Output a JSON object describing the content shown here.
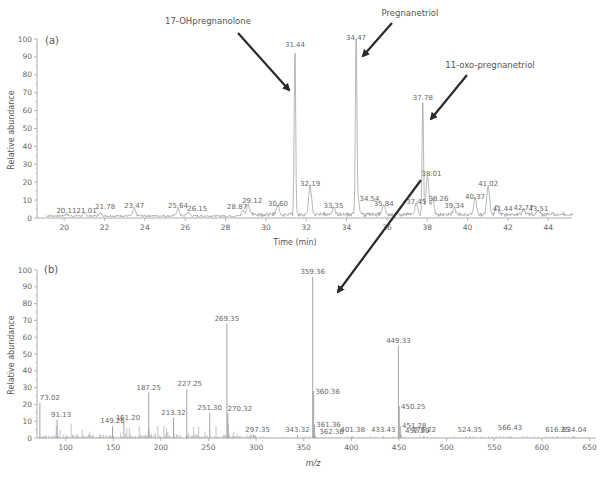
{
  "chart_data": [
    {
      "type": "line",
      "panel": "(a)",
      "title": "",
      "xlabel": "Time (min)",
      "ylabel": "Relative abundance",
      "xlim": [
        18.8,
        45.2
      ],
      "ylim": [
        0,
        100
      ],
      "xticks": [
        20,
        22,
        24,
        26,
        28,
        30,
        32,
        34,
        36,
        38,
        40,
        42,
        44
      ],
      "yticks": [
        0,
        10,
        20,
        30,
        40,
        50,
        60,
        70,
        80,
        90,
        100
      ],
      "grid": false,
      "peaks": [
        {
          "x": 20.11,
          "y": 1,
          "label": "20.11"
        },
        {
          "x": 21.01,
          "y": 1,
          "label": "21.01"
        },
        {
          "x": 21.78,
          "y": 1.5,
          "label": "21.78"
        },
        {
          "x": 23.47,
          "y": 4,
          "label": "23.47"
        },
        {
          "x": 25.64,
          "y": 4,
          "label": "25.64"
        },
        {
          "x": 26.15,
          "y": 2,
          "label": "26.15"
        },
        {
          "x": 28.87,
          "y": 3,
          "label": "28.87"
        },
        {
          "x": 29.12,
          "y": 6,
          "label": "29.12"
        },
        {
          "x": 30.6,
          "y": 5,
          "label": "30.60"
        },
        {
          "x": 31.44,
          "y": 94,
          "label": "31.44"
        },
        {
          "x": 32.19,
          "y": 16,
          "label": "32.19"
        },
        {
          "x": 33.35,
          "y": 4,
          "label": "33.35"
        },
        {
          "x": 34.47,
          "y": 98,
          "label": "34.47"
        },
        {
          "x": 34.54,
          "y": 12,
          "label": "34.54"
        },
        {
          "x": 35.84,
          "y": 5,
          "label": "35.84"
        },
        {
          "x": 37.45,
          "y": 6,
          "label": "37.45"
        },
        {
          "x": 37.78,
          "y": 64,
          "label": "37.78"
        },
        {
          "x": 38.01,
          "y": 22,
          "label": "38.01"
        },
        {
          "x": 38.26,
          "y": 9,
          "label": "38.26"
        },
        {
          "x": 39.34,
          "y": 4,
          "label": "39.34"
        },
        {
          "x": 40.37,
          "y": 9,
          "label": "40.37"
        },
        {
          "x": 41.02,
          "y": 16,
          "label": "41.02"
        },
        {
          "x": 41.44,
          "y": 5,
          "label": "41.44"
        },
        {
          "x": 42.77,
          "y": 3,
          "label": "42.77"
        },
        {
          "x": 43.51,
          "y": 2,
          "label": "43.51"
        }
      ],
      "annotations": [
        {
          "text": "17-OHpregnanolone",
          "points_to": 31.44
        },
        {
          "text": "Pregnanetriol",
          "points_to": 34.47
        },
        {
          "text": "11-oxo-pregnanetriol",
          "points_to": 37.78
        }
      ]
    },
    {
      "type": "bar",
      "panel": "(b)",
      "title": "",
      "xlabel": "m/z",
      "ylabel": "Relative abundance",
      "xlim": [
        70,
        655
      ],
      "ylim": [
        0,
        100
      ],
      "xticks": [
        100,
        150,
        200,
        250,
        300,
        350,
        400,
        450,
        500,
        550,
        600,
        650
      ],
      "yticks": [
        0,
        10,
        20,
        30,
        40,
        50,
        60,
        70,
        80,
        90,
        100
      ],
      "grid": false,
      "peaks": [
        {
          "x": 73.02,
          "y": 21,
          "label": "73.02"
        },
        {
          "x": 91.13,
          "y": 11,
          "label": "91.13"
        },
        {
          "x": 149.26,
          "y": 7,
          "label": "149.26"
        },
        {
          "x": 161.2,
          "y": 9,
          "label": "161.20"
        },
        {
          "x": 187.25,
          "y": 27,
          "label": "187.25"
        },
        {
          "x": 213.32,
          "y": 12,
          "label": "213.32"
        },
        {
          "x": 227.25,
          "y": 29,
          "label": "227.25"
        },
        {
          "x": 251.3,
          "y": 15,
          "label": "251.30"
        },
        {
          "x": 269.35,
          "y": 68,
          "label": "269.35"
        },
        {
          "x": 270.32,
          "y": 15,
          "label": "270.32"
        },
        {
          "x": 297.35,
          "y": 2,
          "label": "297.35"
        },
        {
          "x": 343.32,
          "y": 2,
          "label": "343.32"
        },
        {
          "x": 359.36,
          "y": 96,
          "label": "359.36"
        },
        {
          "x": 360.36,
          "y": 28,
          "label": "360.36"
        },
        {
          "x": 361.36,
          "y": 8,
          "label": "361.36"
        },
        {
          "x": 362.36,
          "y": 1,
          "label": "362.36"
        },
        {
          "x": 401.38,
          "y": 1,
          "label": "401.38"
        },
        {
          "x": 433.43,
          "y": 1,
          "label": "433.43"
        },
        {
          "x": 449.33,
          "y": 55,
          "label": "449.33"
        },
        {
          "x": 450.25,
          "y": 19,
          "label": "450.25"
        },
        {
          "x": 451.28,
          "y": 7,
          "label": "451.28"
        },
        {
          "x": 452.29,
          "y": 2,
          "label": "452.29"
        },
        {
          "x": 476.22,
          "y": 1,
          "label": "476.22"
        },
        {
          "x": 524.35,
          "y": 1,
          "label": "524.35"
        },
        {
          "x": 566.43,
          "y": 1,
          "label": "566.43"
        },
        {
          "x": 616.25,
          "y": 1,
          "label": "616.25"
        },
        {
          "x": 634.04,
          "y": 1,
          "label": "634.04"
        }
      ],
      "annotations": [
        {
          "text": "arrow from 38.01 peak in (a) to 359.36 peak in (b)"
        }
      ]
    }
  ],
  "ui": {
    "panel_a_label": "(a)",
    "panel_b_label": "(b)",
    "panel_a_xlabel": "Time (min)",
    "panel_b_xlabel": "m/z",
    "ylabel": "Relative abundance",
    "annotation_1": "17-OHpregnanolone",
    "annotation_2": "Pregnanetriol",
    "annotation_3": "11-oxo-pregnanetriol"
  },
  "colors": {
    "trace": "#9a9a9a",
    "axis": "#999999",
    "arrow": "#2a2a2a",
    "text": "#555555"
  }
}
